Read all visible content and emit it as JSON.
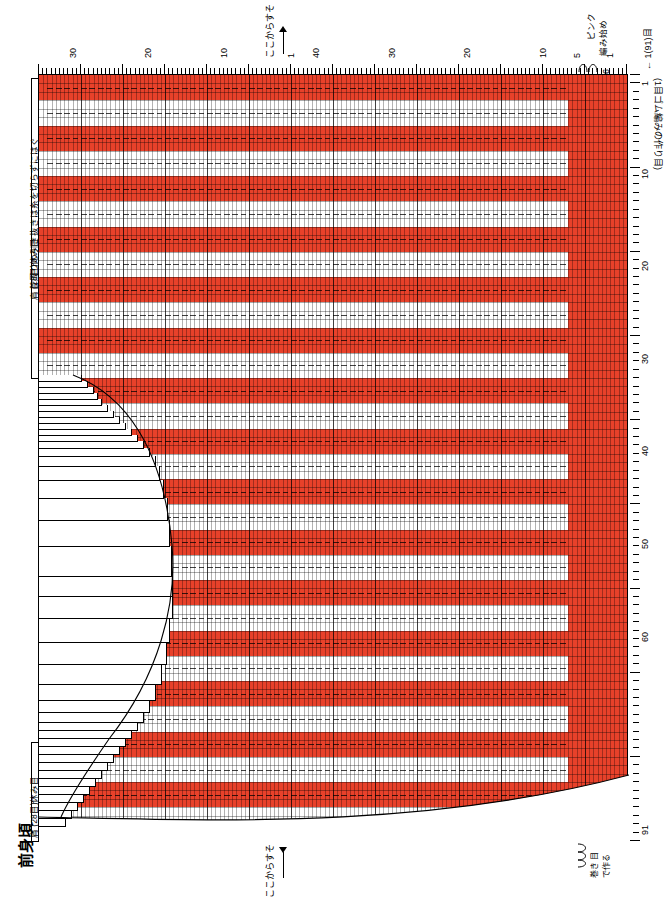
{
  "title": "前身頃",
  "labels": {
    "top_center": "ここからすそ",
    "bottom_center": "ここからすそ",
    "pink_start": "ピンク\n編み始め",
    "row1_arrow": "← 1(91)目",
    "rib_cast_on": "(1目ゴム編みの作り目)",
    "shoulder_top": "肩 (28目)休み目",
    "shoulder_bottom": "肩 (28目)休み目",
    "neck_note": "首周りの引き抜きは糸を切らずにはぐ",
    "attach_yarn": "糸をつける",
    "cast_off_note": "巻き 目\nで作る",
    "pink_count": "6"
  },
  "legend": {
    "title": "",
    "items": [
      {
        "symbol": "□",
        "color": "#ffffff",
        "label": "= 表目"
      },
      {
        "symbol": "",
        "color": "#e8412a",
        "label": "= スカーレット"
      },
      {
        "symbol": "",
        "color": "#f3b8c4",
        "label": "= ピンク"
      },
      {
        "symbol": "",
        "color": "#ffffff",
        "label": "= きなり"
      }
    ]
  },
  "chart_data": {
    "type": "grid-chart",
    "stitch_columns": 91,
    "row_count": 140,
    "x_axis_label_top": "row numbers",
    "x_ticks_top": [
      1,
      5,
      10,
      20,
      30,
      40
    ],
    "x_ticks_top_second": [
      1,
      10,
      20,
      30
    ],
    "y_ticks_right": [
      1,
      10,
      20,
      30,
      40,
      50,
      60,
      91
    ],
    "colors": {
      "scarlet": "#e8412a",
      "pink": "#f3b8c4",
      "natural": "#ffffff",
      "grid": "#000000",
      "background": "#ffffff"
    },
    "stripe_sequence_note": "alternating scarlet / natural vertical stripe pattern with pink block at right edge",
    "pink_block_columns": 6
  },
  "axis_numbers": {
    "top_left_group": [
      "30",
      "20",
      "10",
      "1"
    ],
    "top_right_group": [
      "40",
      "30",
      "20",
      "10",
      "5",
      "1"
    ],
    "right_column": [
      "1",
      "10",
      "20",
      "30",
      "40",
      "50",
      "60",
      "91"
    ]
  }
}
